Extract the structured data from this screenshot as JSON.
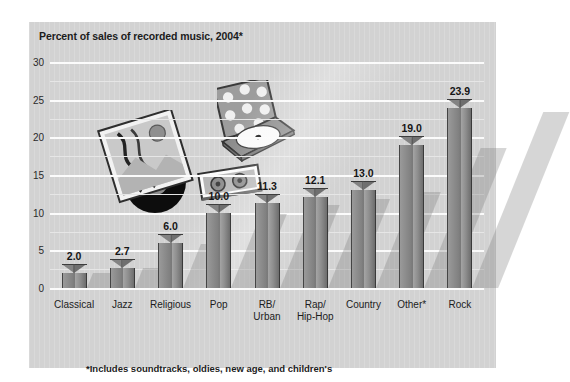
{
  "chart_data": {
    "type": "bar",
    "title": "Percent of sales of recorded music, 2004*",
    "xlabel": "",
    "ylabel": "",
    "ylim": [
      0,
      30
    ],
    "yticks": [
      0,
      5,
      10,
      15,
      20,
      25,
      30
    ],
    "grid": true,
    "legend": "none",
    "categories": [
      "Classical",
      "Jazz",
      "Religious",
      "Pop",
      "RB/\nUrban",
      "Rap/\nHip-Hop",
      "Country",
      "Other*",
      "Rock"
    ],
    "values": [
      2.0,
      2.7,
      6.0,
      10.0,
      11.3,
      12.1,
      13.0,
      19.0,
      23.9
    ],
    "value_labels": [
      "2.0",
      "2.7",
      "6.0",
      "10.0",
      "11.3",
      "12.1",
      "13.0",
      "19.0",
      "23.9"
    ],
    "annotations": [
      "*Includes soundtracks, oldies, new age, and children's"
    ]
  },
  "figure": {
    "title": "Percent of sales of recorded music, 2004*",
    "footnote": "*Includes soundtracks, oldies, new age, and children's",
    "panel_color": "#d2d2d2",
    "bar_color": "#8a8a8a",
    "gridline_color": "#f7f7f7",
    "text_color": "#1c1c1c"
  },
  "yaxis": {
    "labels": [
      "30",
      "25",
      "20",
      "15",
      "10",
      "5",
      "0"
    ],
    "values": [
      30,
      25,
      20,
      15,
      10,
      5,
      0
    ]
  },
  "artwork": {
    "vinyl_record": "vinyl-record-and-sleeve-illustration",
    "compact_disc": "open-cd-jewel-case-illustration",
    "cassette": "cassette-tape-illustration"
  }
}
